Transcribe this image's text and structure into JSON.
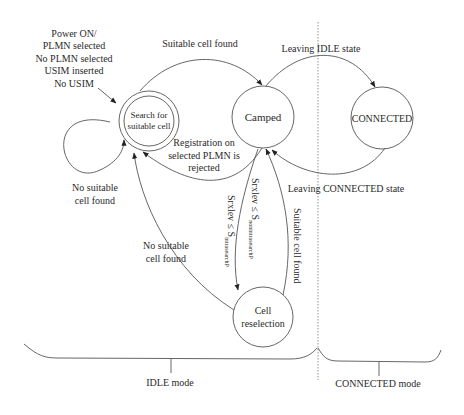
{
  "diagram": {
    "states": {
      "search": {
        "line1": "Search for",
        "line2": "suitable cell"
      },
      "camped": {
        "label": "Camped"
      },
      "connected": {
        "label": "CONNECTED"
      },
      "reselection": {
        "line1": "Cell",
        "line2": "reselection"
      }
    },
    "entry_label": [
      "Power ON/",
      "PLMN selected",
      "No PLMN selected",
      "USIM inserted",
      "No USIM"
    ],
    "transitions": {
      "suitable_cell_found_top": "Suitable cell found",
      "leaving_idle": "Leaving IDLE state",
      "registration_rejected": [
        "Registration on",
        "selected PLMN is",
        "rejected"
      ],
      "leaving_connected": "Leaving CONNECTED state",
      "no_suitable_self": [
        "No suitable",
        "cell found"
      ],
      "no_suitable_reselect": [
        "No suitable",
        "cell found"
      ],
      "srxlev_nonintra": {
        "main": "Srxlev ≤ S",
        "sub": "nonintrasearchP"
      },
      "srxlev_intra": {
        "main": "Srxlev ≤ S",
        "sub": "intrasearchP"
      },
      "suitable_cell_found_reselect": "Suitable cell found"
    },
    "modes": {
      "idle": "IDLE mode",
      "connected": "CONNECTED mode"
    }
  }
}
